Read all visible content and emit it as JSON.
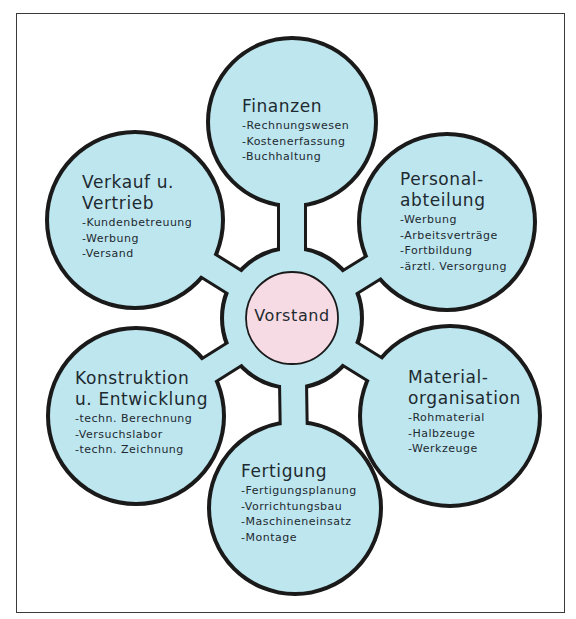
{
  "diagram": {
    "type": "organization-flower-diagram",
    "colors": {
      "petal_fill": "#bde6ef",
      "center_fill": "#f6dbe4",
      "outline": "#1a1a1a",
      "frame": "#3a3a3a"
    },
    "center": {
      "label": "Vorstand"
    },
    "departments": [
      {
        "id": "finanzen",
        "title_lines": [
          "Finanzen"
        ],
        "items": [
          "-Rechnungswesen",
          "-Kostenerfassung",
          "-Buchhaltung"
        ]
      },
      {
        "id": "verkauf",
        "title_lines": [
          "Verkauf u.",
          "Vertrieb"
        ],
        "items": [
          "-Kundenbetreuung",
          "-Werbung",
          "-Versand"
        ]
      },
      {
        "id": "personal",
        "title_lines": [
          "Personal-",
          "abteilung"
        ],
        "items": [
          "-Werbung",
          "-Arbeitsverträge",
          "-Fortbildung",
          "-ärztl. Versorgung"
        ]
      },
      {
        "id": "konstruktion",
        "title_lines": [
          "Konstruktion",
          "u. Entwicklung"
        ],
        "items": [
          "-techn. Berechnung",
          "-Versuchslabor",
          "-techn. Zeichnung"
        ]
      },
      {
        "id": "material",
        "title_lines": [
          "Material-",
          "organisation"
        ],
        "items": [
          "-Rohmaterial",
          "-Halbzeuge",
          "-Werkzeuge"
        ]
      },
      {
        "id": "fertigung",
        "title_lines": [
          "Fertigung"
        ],
        "items": [
          "-Fertigungsplanung",
          "-Vorrichtungsbau",
          "-Maschineneinsatz",
          "-Montage"
        ]
      }
    ]
  }
}
